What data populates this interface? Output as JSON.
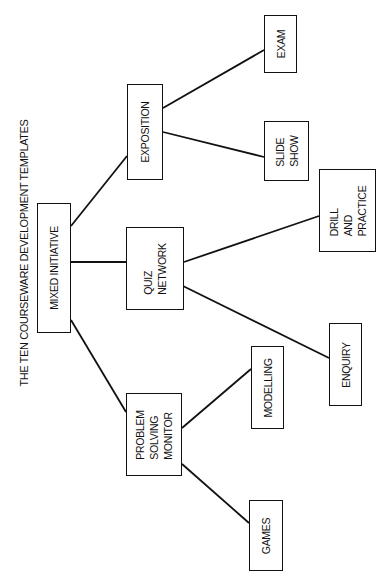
{
  "title": "THE TEN COURSEWARE DEVELOPMENT TEMPLATES",
  "colors": {
    "line": "#111111",
    "background": "#ffffff"
  },
  "nodes": {
    "mixed_initiative": {
      "label": "MIXED INITIATIVE",
      "x": 37,
      "y": 203,
      "w": 34,
      "h": 130
    },
    "exposition": {
      "label": "EXPOSITION",
      "x": 127,
      "y": 84,
      "w": 36,
      "h": 96
    },
    "quiz_network": {
      "label": "QUIZ\nNETWORK",
      "x": 126,
      "y": 227,
      "w": 58,
      "h": 83
    },
    "problem_solving_monitor": {
      "label": "PROBLEM\nSOLVING\nMONITOR",
      "x": 126,
      "y": 393,
      "w": 56,
      "h": 83
    },
    "exam": {
      "label": "EXAM",
      "x": 264,
      "y": 15,
      "w": 33,
      "h": 58
    },
    "slide_show": {
      "label": "SLIDE\nSHOW",
      "x": 264,
      "y": 121,
      "w": 45,
      "h": 60
    },
    "drill_and_practice": {
      "label": "DRILL\nAND\nPRACTICE",
      "x": 319,
      "y": 169,
      "w": 57,
      "h": 83
    },
    "enquiry": {
      "label": "ENQUIRY",
      "x": 329,
      "y": 323,
      "w": 33,
      "h": 83
    },
    "modelling": {
      "label": "MODELLING",
      "x": 251,
      "y": 346,
      "w": 33,
      "h": 83
    },
    "games": {
      "label": "GAMES",
      "x": 249,
      "y": 500,
      "w": 34,
      "h": 71
    }
  },
  "edges": [
    {
      "from": "mixed_initiative",
      "to": "exposition",
      "x1": 71,
      "y1": 226,
      "x2": 127,
      "y2": 156
    },
    {
      "from": "mixed_initiative",
      "to": "quiz_network",
      "x1": 71,
      "y1": 262,
      "x2": 126,
      "y2": 262
    },
    {
      "from": "mixed_initiative",
      "to": "problem_solving_monitor",
      "x1": 71,
      "y1": 320,
      "x2": 126,
      "y2": 412
    },
    {
      "from": "exposition",
      "to": "exam",
      "x1": 163,
      "y1": 108,
      "x2": 264,
      "y2": 50
    },
    {
      "from": "exposition",
      "to": "slide_show",
      "x1": 163,
      "y1": 132,
      "x2": 264,
      "y2": 157
    },
    {
      "from": "quiz_network",
      "to": "drill_and_practice",
      "x1": 184,
      "y1": 262,
      "x2": 319,
      "y2": 216
    },
    {
      "from": "quiz_network",
      "to": "enquiry",
      "x1": 183,
      "y1": 286,
      "x2": 329,
      "y2": 358
    },
    {
      "from": "problem_solving_monitor",
      "to": "modelling",
      "x1": 182,
      "y1": 428,
      "x2": 251,
      "y2": 369
    },
    {
      "from": "problem_solving_monitor",
      "to": "games",
      "x1": 182,
      "y1": 464,
      "x2": 249,
      "y2": 523
    }
  ]
}
